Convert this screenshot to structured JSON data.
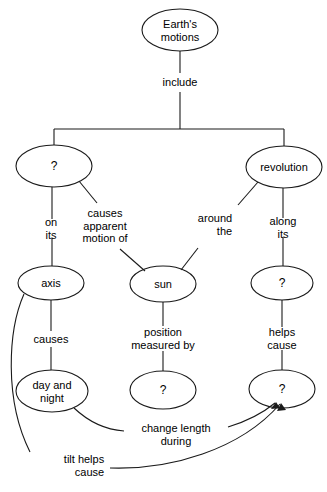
{
  "diagram": {
    "background_color": "#ffffff",
    "stroke_color": "#1a1a1a",
    "text_color": "#000000",
    "nodes": [
      {
        "id": "earths-motions",
        "label": "Earth's\nmotions",
        "cx": 180,
        "cy": 30,
        "rx": 38,
        "ry": 21
      },
      {
        "id": "rotation-unknown",
        "label": "?",
        "cx": 54,
        "cy": 166,
        "rx": 38,
        "ry": 21
      },
      {
        "id": "revolution",
        "label": "revolution",
        "cx": 284,
        "cy": 167,
        "rx": 38,
        "ry": 21
      },
      {
        "id": "axis",
        "label": "axis",
        "cx": 51,
        "cy": 283,
        "rx": 33,
        "ry": 17
      },
      {
        "id": "sun",
        "label": "sun",
        "cx": 163,
        "cy": 284,
        "rx": 33,
        "ry": 18
      },
      {
        "id": "orbit-unknown",
        "label": "?",
        "cx": 282,
        "cy": 283,
        "rx": 31,
        "ry": 17
      },
      {
        "id": "day-and-night",
        "label": "day and\nnight",
        "cx": 52,
        "cy": 391,
        "rx": 36,
        "ry": 21
      },
      {
        "id": "position-unknown",
        "label": "?",
        "cx": 163,
        "cy": 390,
        "rx": 33,
        "ry": 19
      },
      {
        "id": "seasons-unknown",
        "label": "?",
        "cx": 282,
        "cy": 389,
        "rx": 33,
        "ry": 19
      }
    ],
    "link_labels": [
      {
        "id": "include",
        "label": "include",
        "x": 180,
        "y": 82
      },
      {
        "id": "on-its",
        "label": "on\nits",
        "x": 51,
        "y": 228
      },
      {
        "id": "causes-apparent-motion-of",
        "label": "causes\napparent\nmotion of",
        "x": 105,
        "y": 226
      },
      {
        "id": "around-the",
        "label": "around\nthe",
        "x": 215,
        "y": 224
      },
      {
        "id": "along-its",
        "label": "along\nits",
        "x": 283,
        "y": 227
      },
      {
        "id": "causes",
        "label": "causes",
        "x": 51,
        "y": 339
      },
      {
        "id": "position-measured-by",
        "label": "position\nmeasured by",
        "x": 163,
        "y": 338
      },
      {
        "id": "helps-cause",
        "label": "helps\ncause",
        "x": 282,
        "y": 338
      },
      {
        "id": "change-length-during",
        "label": "change length\nduring",
        "x": 176,
        "y": 434
      },
      {
        "id": "tilt-helps-cause",
        "label": "tilt helps\ncause",
        "x": 84,
        "y": 465
      }
    ],
    "edges": [
      {
        "id": "edge-earth-to-include",
        "from": "earths-motions",
        "to": "include"
      },
      {
        "id": "edge-include-to-branches",
        "from": "include",
        "to": "branch-bar"
      },
      {
        "id": "edge-branch-to-rotation",
        "from": "branch-bar",
        "to": "rotation-unknown"
      },
      {
        "id": "edge-branch-to-revolution",
        "from": "branch-bar",
        "to": "revolution"
      },
      {
        "id": "edge-rotation-to-axis",
        "from": "rotation-unknown",
        "to": "axis",
        "label": "on its"
      },
      {
        "id": "edge-rotation-to-sun",
        "from": "rotation-unknown",
        "to": "sun",
        "label": "causes apparent motion of"
      },
      {
        "id": "edge-revolution-to-sun",
        "from": "revolution",
        "to": "sun",
        "label": "around the"
      },
      {
        "id": "edge-revolution-to-orbit",
        "from": "revolution",
        "to": "orbit-unknown",
        "label": "along its"
      },
      {
        "id": "edge-axis-to-day-night",
        "from": "axis",
        "to": "day-and-night",
        "label": "causes"
      },
      {
        "id": "edge-sun-to-position",
        "from": "sun",
        "to": "position-unknown",
        "label": "position measured by"
      },
      {
        "id": "edge-orbit-to-seasons",
        "from": "orbit-unknown",
        "to": "seasons-unknown",
        "label": "helps cause"
      },
      {
        "id": "edge-day-night-to-seasons",
        "from": "day-and-night",
        "to": "seasons-unknown",
        "label": "change length during",
        "arrow": true
      },
      {
        "id": "edge-axis-to-seasons",
        "from": "axis",
        "to": "seasons-unknown",
        "label": "tilt helps cause",
        "arrow": true
      }
    ]
  }
}
